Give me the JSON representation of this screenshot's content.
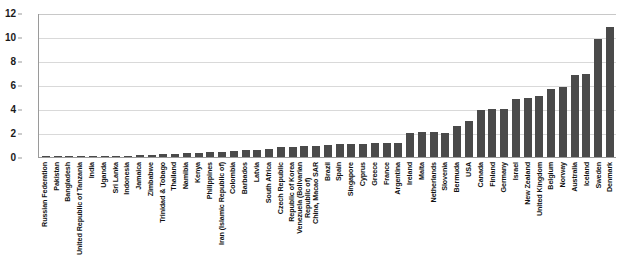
{
  "chart_data": {
    "type": "bar",
    "title": "",
    "xlabel": "",
    "ylabel": "",
    "ylim": [
      0,
      12
    ],
    "y_ticks": [
      0,
      2,
      4,
      6,
      8,
      10,
      12
    ],
    "grid": true,
    "legend": false,
    "bar_color": "#4a4a4a",
    "categories": [
      "Russian Federation",
      "Pakistan",
      "Bangladesh",
      "United Republic of Tanzania",
      "India",
      "Uganda",
      "Sri Lanka",
      "Indonesia",
      "Jamaica",
      "Zimbabwe",
      "Trinidad & Tobago",
      "Thailand",
      "Namibia",
      "Kenya",
      "Philippines",
      "Iran (Islamic Republic of)",
      "Colombia",
      "Barbados",
      "Latvia",
      "South Africa",
      "Czech Republic",
      "Republic of Korea",
      "Venezuela (Bolivarian\nRepublic of)",
      "China, Macao SAR",
      "Brazil",
      "Spain",
      "Singapore",
      "Cyprus",
      "Greece",
      "France",
      "Argentina",
      "Ireland",
      "Malta",
      "Netherlands",
      "Slovenia",
      "Bermuda",
      "USA",
      "Canada",
      "Finland",
      "Germany",
      "Israel",
      "New Zealand",
      "United Kingdom",
      "Belgium",
      "Norway",
      "Australia",
      "Iceland",
      "Sweden",
      "Denmark"
    ],
    "values": [
      0.03,
      0.04,
      0.05,
      0.06,
      0.07,
      0.08,
      0.1,
      0.12,
      0.18,
      0.2,
      0.22,
      0.25,
      0.3,
      0.35,
      0.4,
      0.45,
      0.5,
      0.55,
      0.6,
      0.7,
      0.8,
      0.85,
      0.9,
      0.95,
      1.0,
      1.05,
      1.1,
      1.1,
      1.15,
      1.2,
      1.2,
      2.0,
      2.05,
      2.05,
      2.0,
      2.6,
      3.0,
      3.9,
      4.0,
      4.0,
      4.8,
      4.9,
      5.1,
      5.7,
      5.8,
      6.8,
      6.9,
      9.8,
      10.8
    ]
  }
}
